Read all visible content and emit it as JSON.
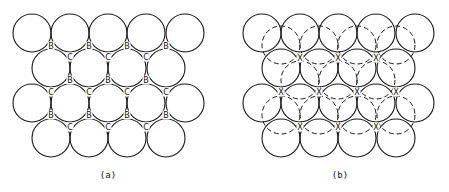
{
  "figure": {
    "panels": [
      {
        "id": "a",
        "caption": "(a)",
        "caption_pos": [
          108,
          175
        ],
        "radius": 19,
        "solid_circles": [
          [
            32,
            33
          ],
          [
            70,
            33
          ],
          [
            108,
            33
          ],
          [
            146,
            33
          ],
          [
            185,
            33
          ],
          [
            51,
            68
          ],
          [
            89,
            68
          ],
          [
            127,
            68
          ],
          [
            166,
            68
          ],
          [
            32,
            103
          ],
          [
            70,
            103
          ],
          [
            108,
            103
          ],
          [
            146,
            103
          ],
          [
            185,
            103
          ],
          [
            51,
            138
          ],
          [
            89,
            138
          ],
          [
            127,
            138
          ],
          [
            166,
            138
          ]
        ],
        "site_labels": [
          {
            "t": "B",
            "x": 51,
            "y": 46
          },
          {
            "t": "B",
            "x": 89,
            "y": 46
          },
          {
            "t": "B",
            "x": 127,
            "y": 46
          },
          {
            "t": "B",
            "x": 166,
            "y": 46
          },
          {
            "t": "C",
            "x": 70,
            "y": 57
          },
          {
            "t": "C",
            "x": 108,
            "y": 57
          },
          {
            "t": "C",
            "x": 146,
            "y": 57
          },
          {
            "t": "B",
            "x": 70,
            "y": 80
          },
          {
            "t": "B",
            "x": 108,
            "y": 80
          },
          {
            "t": "B",
            "x": 146,
            "y": 80
          },
          {
            "t": "C",
            "x": 51,
            "y": 92
          },
          {
            "t": "C",
            "x": 89,
            "y": 92
          },
          {
            "t": "C",
            "x": 127,
            "y": 92
          },
          {
            "t": "C",
            "x": 166,
            "y": 92
          },
          {
            "t": "B",
            "x": 51,
            "y": 115
          },
          {
            "t": "B",
            "x": 89,
            "y": 115
          },
          {
            "t": "B",
            "x": 127,
            "y": 115
          },
          {
            "t": "B",
            "x": 166,
            "y": 115
          },
          {
            "t": "C",
            "x": 70,
            "y": 127
          },
          {
            "t": "C",
            "x": 108,
            "y": 127
          },
          {
            "t": "C",
            "x": 146,
            "y": 127
          }
        ]
      },
      {
        "id": "b",
        "caption": "(b)",
        "caption_pos": [
          340,
          175
        ],
        "radius": 19,
        "solid_circles": [
          [
            262,
            33
          ],
          [
            300,
            33
          ],
          [
            338,
            33
          ],
          [
            376,
            33
          ],
          [
            415,
            33
          ],
          [
            281,
            68
          ],
          [
            319,
            68
          ],
          [
            357,
            68
          ],
          [
            396,
            68
          ],
          [
            262,
            103
          ],
          [
            300,
            103
          ],
          [
            338,
            103
          ],
          [
            376,
            103
          ],
          [
            415,
            103
          ],
          [
            281,
            138
          ],
          [
            319,
            138
          ],
          [
            357,
            138
          ],
          [
            396,
            138
          ]
        ],
        "dashed_circles": [
          [
            281,
            45
          ],
          [
            319,
            45
          ],
          [
            357,
            45
          ],
          [
            396,
            45
          ],
          [
            300,
            80
          ],
          [
            338,
            80
          ],
          [
            376,
            80
          ],
          [
            281,
            115
          ],
          [
            319,
            115
          ],
          [
            357,
            115
          ],
          [
            396,
            115
          ]
        ],
        "site_labels": [
          {
            "t": "X",
            "x": 300,
            "y": 58
          },
          {
            "t": "X",
            "x": 338,
            "y": 58
          },
          {
            "t": "X",
            "x": 376,
            "y": 58
          },
          {
            "t": "X",
            "x": 281,
            "y": 92
          },
          {
            "t": "X",
            "x": 319,
            "y": 92
          },
          {
            "t": "X",
            "x": 357,
            "y": 92
          },
          {
            "t": "X",
            "x": 396,
            "y": 92
          },
          {
            "t": "X",
            "x": 300,
            "y": 127
          },
          {
            "t": "X",
            "x": 338,
            "y": 127
          },
          {
            "t": "X",
            "x": 376,
            "y": 127
          }
        ]
      }
    ]
  }
}
